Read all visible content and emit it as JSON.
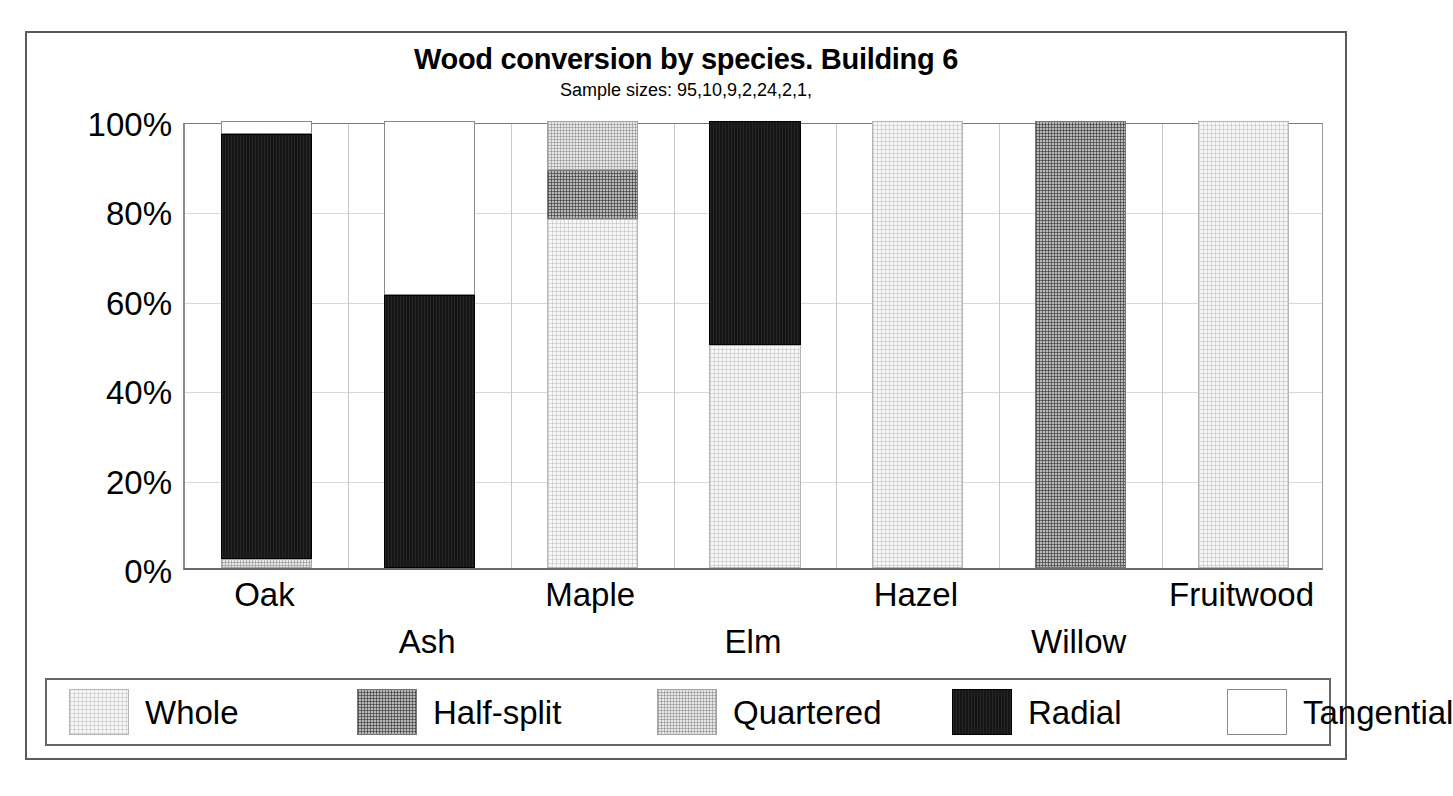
{
  "chart_data": {
    "type": "bar",
    "subtype": "stacked-100-percent",
    "title": "Wood conversion by species. Building 6",
    "subtitle": "Sample sizes: 95,10,9,2,24,2,1,",
    "xlabel": "",
    "ylabel": "",
    "ylim": [
      0,
      100
    ],
    "ytick_labels": [
      "0%",
      "20%",
      "40%",
      "60%",
      "80%",
      "100%"
    ],
    "ytick_values": [
      0,
      20,
      40,
      60,
      80,
      100
    ],
    "grid": true,
    "legend_position": "bottom",
    "sample_sizes": [
      95,
      10,
      9,
      2,
      24,
      2,
      1
    ],
    "categories": [
      "Oak",
      "Ash",
      "Maple",
      "Elm",
      "Hazel",
      "Willow",
      "Fruitwood"
    ],
    "series": [
      {
        "name": "Whole",
        "fill": "whole",
        "color": "#f7f7f7",
        "values": [
          0,
          0,
          78,
          50,
          100,
          0,
          100
        ]
      },
      {
        "name": "Half-split",
        "fill": "half",
        "color": "#b9b9b9",
        "values": [
          0,
          0,
          11,
          0,
          0,
          100,
          0
        ]
      },
      {
        "name": "Quartered",
        "fill": "quartered",
        "color": "#e8e8e8",
        "values": [
          2,
          0,
          11,
          0,
          0,
          0,
          0
        ]
      },
      {
        "name": "Radial",
        "fill": "radial",
        "color": "#161616",
        "values": [
          95,
          61,
          0,
          50,
          0,
          0,
          0
        ]
      },
      {
        "name": "Tangential",
        "fill": "tangential",
        "color": "#ffffff",
        "values": [
          3,
          39,
          0,
          0,
          0,
          0,
          0
        ]
      }
    ]
  },
  "legend": {
    "items": [
      {
        "label": "Whole",
        "fill": "whole"
      },
      {
        "label": "Half-split",
        "fill": "half"
      },
      {
        "label": "Quartered",
        "fill": "quartered"
      },
      {
        "label": "Radial",
        "fill": "radial"
      },
      {
        "label": "Tangential",
        "fill": "tangential"
      }
    ]
  }
}
